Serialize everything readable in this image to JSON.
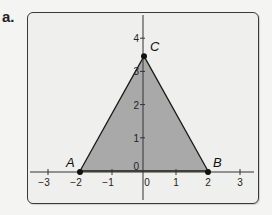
{
  "part_label": "a.",
  "colors": {
    "background": "#f4f4f2",
    "frame_fill": "#efefed",
    "frame_border": "#3a3a3a",
    "triangle_fill": "#a9a9a9",
    "axis": "#333333",
    "point": "#111111"
  },
  "chart_data": {
    "type": "diagram",
    "title": "",
    "xlabel": "",
    "ylabel": "",
    "xlim": [
      -3.5,
      3.5
    ],
    "ylim": [
      0,
      4.5
    ],
    "grid": false,
    "x_ticks": [
      {
        "value": -3,
        "label": "−3"
      },
      {
        "value": -2,
        "label": "−2"
      },
      {
        "value": -1,
        "label": "−1"
      },
      {
        "value": 0,
        "label": "0"
      },
      {
        "value": 1,
        "label": "1"
      },
      {
        "value": 2,
        "label": "2"
      },
      {
        "value": 3,
        "label": "3"
      }
    ],
    "y_ticks": [
      {
        "value": 0,
        "label": "0"
      },
      {
        "value": 1,
        "label": "1"
      },
      {
        "value": 2,
        "label": "2"
      },
      {
        "value": 3,
        "label": "3"
      },
      {
        "value": 4,
        "label": "4"
      }
    ],
    "points": [
      {
        "name": "A",
        "x": -2,
        "y": 0
      },
      {
        "name": "B",
        "x": 2,
        "y": 0
      },
      {
        "name": "C",
        "x": 0,
        "y": 3.46
      }
    ],
    "shapes": [
      {
        "type": "triangle",
        "vertices": [
          "A",
          "B",
          "C"
        ],
        "filled": true
      }
    ]
  }
}
